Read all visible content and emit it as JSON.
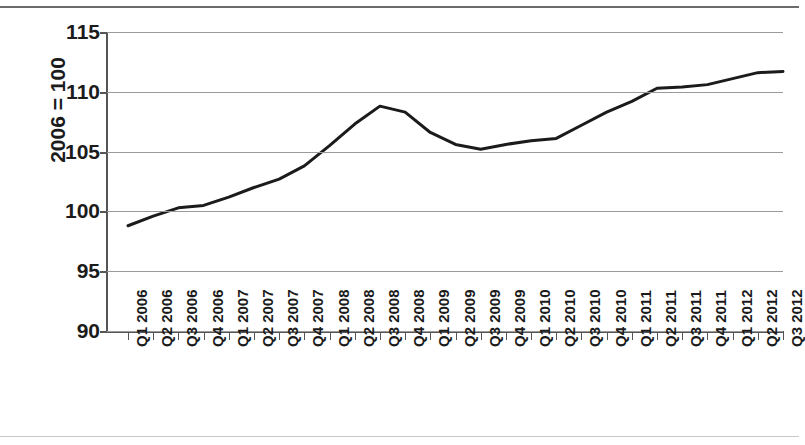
{
  "chart_data": {
    "type": "line",
    "title": "",
    "subtitle": "",
    "xlabel": "",
    "ylabel": "2006 = 100",
    "ylim": [
      90,
      115
    ],
    "yticks": [
      90,
      95,
      100,
      105,
      110,
      115
    ],
    "ytick_labels": [
      "90",
      "95",
      "100",
      "105",
      "110",
      "115"
    ],
    "grid": true,
    "legend": false,
    "legend_position": "none",
    "line_color": "#1b1b1b",
    "line_width": 3,
    "categories": [
      "Q1 2006",
      "Q2 2006",
      "Q3 2006",
      "Q4 2006",
      "Q1 2007",
      "Q2 2007",
      "Q3 2007",
      "Q4 2007",
      "Q1 2008",
      "Q2 2008",
      "Q3 2008",
      "Q4 2008",
      "Q1 2009",
      "Q2 2009",
      "Q3 2009",
      "Q4 2009",
      "Q1 2010",
      "Q2 2010",
      "Q3 2010",
      "Q4 2010",
      "Q1 2011",
      "Q2 2011",
      "Q3 2011",
      "Q4 2011",
      "Q1 2012",
      "Q2 2012",
      "Q3 2012"
    ],
    "values": [
      98.8,
      99.6,
      100.3,
      100.5,
      101.2,
      102.0,
      102.7,
      103.8,
      105.5,
      107.3,
      108.8,
      108.3,
      106.6,
      105.6,
      105.2,
      105.6,
      105.9,
      106.1,
      107.2,
      108.3,
      109.2,
      110.3,
      110.4,
      110.6,
      111.1,
      111.6,
      111.7
    ]
  },
  "axis": {
    "y_label": "2006 = 100"
  }
}
